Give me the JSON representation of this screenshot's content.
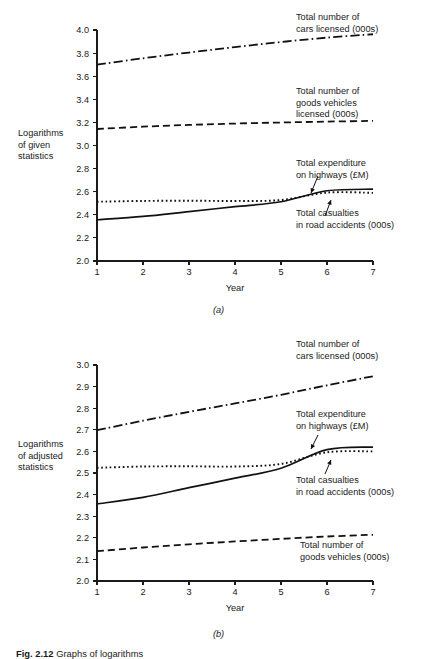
{
  "figure": {
    "caption_ref": "Fig. 2.12",
    "caption_text": "Graphs of logarithms"
  },
  "panels": [
    {
      "id": "a",
      "letter": "(a)",
      "y_axis_label_lines": [
        "Logarithms",
        "of given",
        "statistics"
      ],
      "x_axis_label": "Year",
      "y_ticks": [
        "2.0",
        "2.2",
        "2.4",
        "2.6",
        "2.8",
        "3.0",
        "3.2",
        "3.4",
        "3.6",
        "3.8",
        "4.0"
      ],
      "x_ticks": [
        "1",
        "2",
        "3",
        "4",
        "5",
        "6",
        "7"
      ],
      "annotations": [
        {
          "id": "cars",
          "lines": [
            "Total number of",
            "cars licensed (000s)"
          ],
          "arrow": false
        },
        {
          "id": "goods",
          "lines": [
            "Total number of",
            "goods vehicles",
            "licensed (000s)"
          ],
          "arrow": false
        },
        {
          "id": "expenditure",
          "lines": [
            "Total expenditure",
            "on highways (£M)"
          ],
          "arrow": true
        },
        {
          "id": "casualties",
          "lines": [
            "Total casualties",
            "in road accidents (000s)"
          ],
          "arrow": true
        }
      ]
    },
    {
      "id": "b",
      "letter": "(b)",
      "y_axis_label_lines": [
        "Logarithms",
        "of adjusted",
        "statistics"
      ],
      "x_axis_label": "Year",
      "y_ticks": [
        "2.0",
        "2.1",
        "2.2",
        "2.3",
        "2.4",
        "2.5",
        "2.6",
        "2.7",
        "2.8",
        "2.9",
        "3.0"
      ],
      "x_ticks": [
        "1",
        "2",
        "3",
        "4",
        "5",
        "6",
        "7"
      ],
      "annotations": [
        {
          "id": "cars",
          "lines": [
            "Total number of",
            "cars licensed (000s)"
          ],
          "arrow": false
        },
        {
          "id": "expenditure",
          "lines": [
            "Total expenditure",
            "on highways (£M)"
          ],
          "arrow": true
        },
        {
          "id": "casualties",
          "lines": [
            "Total casualties",
            "in road accidents (000s)"
          ],
          "arrow": true
        },
        {
          "id": "goods",
          "lines": [
            "Total number of",
            "goods vehicles (000s)"
          ],
          "arrow": false
        }
      ]
    }
  ],
  "chart_data": [
    {
      "type": "line",
      "panel": "a",
      "title": "",
      "xlabel": "Year",
      "ylabel": "Logarithms of given statistics",
      "x": [
        1,
        2,
        3,
        4,
        5,
        6,
        7
      ],
      "xlim": [
        1,
        7
      ],
      "ylim": [
        2.0,
        4.0
      ],
      "ytick_step": 0.2,
      "grid": false,
      "legend": "inline-annotations",
      "series": [
        {
          "name": "Total number of cars licensed (000s)",
          "style": "dash-dot",
          "values": [
            3.7,
            3.755,
            3.805,
            3.852,
            3.896,
            3.934,
            3.963
          ]
        },
        {
          "name": "Total number of goods vehicles licensed (000s)",
          "style": "dashed",
          "values": [
            3.143,
            3.163,
            3.178,
            3.19,
            3.199,
            3.207,
            3.213
          ]
        },
        {
          "name": "Total expenditure on highways (£M)",
          "style": "solid",
          "values": [
            2.357,
            2.386,
            2.428,
            2.47,
            2.513,
            2.608,
            2.622
          ]
        },
        {
          "name": "Total casualties in road accidents (000s)",
          "style": "dotted",
          "values": [
            2.513,
            2.52,
            2.522,
            2.52,
            2.528,
            2.592,
            2.59
          ]
        }
      ]
    },
    {
      "type": "line",
      "panel": "b",
      "title": "",
      "xlabel": "Year",
      "ylabel": "Logarithms of adjusted statistics",
      "x": [
        1,
        2,
        3,
        4,
        5,
        6,
        7
      ],
      "xlim": [
        1,
        7
      ],
      "ylim": [
        2.0,
        3.0
      ],
      "ytick_step": 0.1,
      "grid": false,
      "legend": "inline-annotations",
      "series": [
        {
          "name": "Total number of cars licensed (000s)",
          "style": "dash-dot",
          "values": [
            2.698,
            2.742,
            2.783,
            2.822,
            2.862,
            2.906,
            2.948
          ]
        },
        {
          "name": "Total expenditure on highways (£M)",
          "style": "solid",
          "values": [
            2.357,
            2.387,
            2.432,
            2.476,
            2.522,
            2.608,
            2.62
          ]
        },
        {
          "name": "Total casualties in road accidents (000s)",
          "style": "dotted",
          "values": [
            2.524,
            2.53,
            2.531,
            2.53,
            2.542,
            2.596,
            2.6
          ]
        },
        {
          "name": "Total number of goods vehicles (000s)",
          "style": "dashed",
          "values": [
            2.138,
            2.155,
            2.17,
            2.183,
            2.195,
            2.206,
            2.214
          ]
        }
      ]
    }
  ]
}
